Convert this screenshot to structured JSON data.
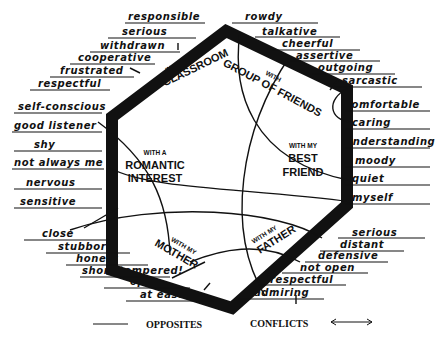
{
  "diagram": {
    "type": "hexagon-self-concept-map",
    "contexts": [
      {
        "id": "classroom",
        "small": "IN THE",
        "big": "CLASSROOM"
      },
      {
        "id": "friends",
        "small": "WITH",
        "big": "GROUP OF FRIENDS"
      },
      {
        "id": "bestfriend",
        "small": "WITH MY",
        "big1": "BEST",
        "big2": "FRIEND"
      },
      {
        "id": "father",
        "small": "WITH MY",
        "big": "FATHER"
      },
      {
        "id": "mother",
        "small": "WITH MY",
        "big": "MOTHER"
      },
      {
        "id": "romantic",
        "small": "WITH A",
        "big1": "ROMANTIC",
        "big2": "INTEREST"
      }
    ],
    "traits": {
      "classroom": [
        "responsible",
        "serious",
        "withdrawn",
        "cooperative",
        "frustrated",
        "respectful"
      ],
      "friends": [
        "rowdy",
        "talkative",
        "cheerful",
        "assertive",
        "outgoing",
        "sarcastic"
      ],
      "bestfriend": [
        "comfortable",
        "caring",
        "understanding",
        "moody",
        "quiet",
        "myself"
      ],
      "father": [
        "serious",
        "distant",
        "defensive",
        "not open",
        "respectful",
        "admiring"
      ],
      "mother": [
        "close",
        "stubborn",
        "honest",
        "short tempered!",
        "open",
        "at ease"
      ],
      "romantic": [
        "self-conscious",
        "good listener",
        "shy",
        "not always me",
        "nervous",
        "sensitive"
      ]
    },
    "legend": {
      "opposites_label": "OPPOSITES",
      "conflicts_label": "CONFLICTS",
      "opposites_symbol": "line",
      "conflicts_symbol": "double-arrow"
    },
    "colors": {
      "ink": "#111111",
      "background": "#ffffff"
    }
  }
}
